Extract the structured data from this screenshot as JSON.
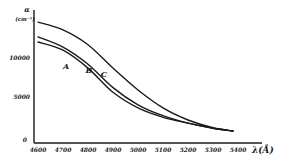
{
  "chart_data": {
    "type": "line",
    "title": "",
    "xlabel": "λ(Å)",
    "ylabel": "α(cm⁻¹)",
    "ylabel_lines": [
      "α",
      "(cm⁻¹)"
    ],
    "xlim": [
      4600,
      5500
    ],
    "ylim": [
      0,
      15000
    ],
    "x_ticks": [
      4600,
      4700,
      4800,
      4900,
      5000,
      5100,
      5200,
      5300,
      5400
    ],
    "x_tick_labels": [
      "4600",
      "4700",
      "4800",
      "4900",
      "5000",
      "5100",
      "5200",
      "5300",
      "5400"
    ],
    "y_ticks": [
      0,
      5000,
      10000
    ],
    "y_tick_labels": [
      "0",
      "5000",
      "10000"
    ],
    "grid": false,
    "legend": "inline-labels",
    "series": [
      {
        "name": "A",
        "x": [
          4600,
          4700,
          4800,
          4900,
          5000,
          5100,
          5200,
          5300,
          5380
        ],
        "y": [
          12050,
          11000,
          8700,
          5600,
          3600,
          2400,
          1650,
          1000,
          640
        ],
        "label_at": [
          4712,
          9000
        ]
      },
      {
        "name": "B",
        "x": [
          4600,
          4700,
          4800,
          4900,
          5000,
          5100,
          5200,
          5300,
          5380
        ],
        "y": [
          12700,
          11400,
          9200,
          6200,
          4000,
          2600,
          1650,
          1000,
          640
        ],
        "label_at": [
          4804,
          8500
        ]
      },
      {
        "name": "C",
        "x": [
          4600,
          4700,
          4800,
          4900,
          5000,
          5100,
          5200,
          5300,
          5380
        ],
        "y": [
          14600,
          13600,
          11700,
          8700,
          5900,
          3600,
          2050,
          1050,
          640
        ],
        "label_at": [
          4864,
          7950
        ]
      }
    ]
  }
}
